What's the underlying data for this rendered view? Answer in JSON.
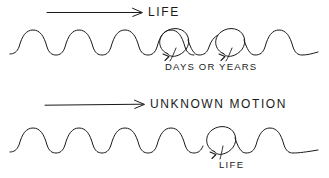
{
  "figure": {
    "title_visible": false,
    "background_color": "#ffffff",
    "ink_color": "#1a1a1a",
    "stroke_width": 1.0,
    "panels": [
      {
        "name": "top-panel",
        "arrow": {
          "label": "LIFE",
          "direction": "right",
          "x1": 47,
          "x2": 142,
          "y": 12
        },
        "wave": {
          "baseline_y": 52,
          "amplitude": 22,
          "start_x": 10,
          "end_x": 318,
          "hump_count": 7,
          "loop_indices": [
            4,
            5
          ]
        },
        "annotation": {
          "label": "DAYS OR YEARS",
          "x": 165,
          "y": 62
        }
      },
      {
        "name": "bottom-panel",
        "arrow": {
          "label": "UNKNOWN MOTION",
          "direction": "right",
          "x1": 45,
          "x2": 144,
          "y": 104
        },
        "wave": {
          "baseline_y": 150,
          "amplitude": 20,
          "start_x": 10,
          "end_x": 318,
          "hump_count": 8,
          "loop_indices": [
            5
          ]
        },
        "annotation": {
          "label": "LIFE",
          "x": 219,
          "y": 160
        }
      }
    ]
  },
  "labels": {
    "life_top": "LIFE",
    "days_or_years": "DAYS  OR  YEARS",
    "unknown_motion": "UNKNOWN  MOTION",
    "life_bottom": "LIFE"
  }
}
